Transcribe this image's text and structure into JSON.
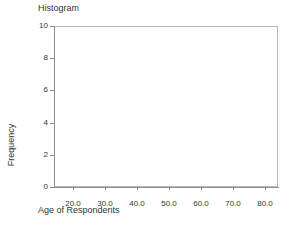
{
  "chart_data": {
    "type": "bar",
    "title": "Histogram",
    "subtitle": "",
    "xlabel": "Age of Respondents",
    "ylabel": "Frequency",
    "xlim": [
      15.0,
      85.0
    ],
    "ylim": [
      0,
      10
    ],
    "grid": false,
    "legend": null,
    "x_ticks": [
      20.0,
      30.0,
      40.0,
      50.0,
      60.0,
      70.0,
      80.0
    ],
    "x_tick_labels": [
      "20.0",
      "30.0",
      "40.0",
      "50.0",
      "60.0",
      "70.0",
      "80.0"
    ],
    "y_ticks": [
      0,
      2,
      4,
      6,
      8,
      10
    ],
    "y_tick_labels": [
      "0",
      "2",
      "4",
      "6",
      "8",
      "10"
    ],
    "categories": [],
    "values": [],
    "bins": [],
    "annotations": []
  },
  "chart": {
    "title": "Histogram",
    "x_axis_title": "Age of Respondents",
    "y_axis_title": "Frequency",
    "frame_color": "#b9b9b9",
    "axis_color": "#8e8e8e",
    "text_color": "#333333",
    "background": "#ffffff",
    "bar_color": "#6a9fd8"
  }
}
